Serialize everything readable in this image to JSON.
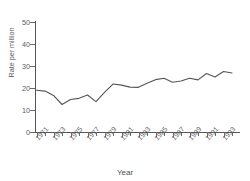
{
  "figure": {
    "title_fragment": "",
    "background": "#ffffff",
    "line_color": "#555555",
    "axis_color": "#565656",
    "text_color": "#5b5b5b"
  },
  "chart_data": {
    "type": "line",
    "title": "",
    "xlabel": "Year",
    "ylabel": "Rate per million",
    "ylim": [
      0,
      50
    ],
    "xlim": [
      1971,
      1994
    ],
    "yticks": [
      0,
      10,
      20,
      30,
      40,
      50
    ],
    "ytick_labels": [
      "0",
      "10",
      "20",
      "30",
      "40",
      "50"
    ],
    "xtick_labels": [
      "1971",
      "1973",
      "1975",
      "1977",
      "1979",
      "1981",
      "1983",
      "1985",
      "1987",
      "1989",
      "1991",
      "1993"
    ],
    "grid": false,
    "legend": false,
    "x": [
      1971,
      1972,
      1973,
      1974,
      1975,
      1976,
      1977,
      1978,
      1979,
      1980,
      1981,
      1982,
      1983,
      1984,
      1985,
      1986,
      1987,
      1988,
      1989,
      1990,
      1991,
      1992,
      1993,
      1994
    ],
    "values": [
      19.0,
      18.6,
      16.6,
      12.5,
      14.8,
      15.3,
      16.8,
      13.8,
      18.0,
      21.8,
      21.3,
      20.4,
      20.3,
      22.2,
      23.8,
      24.4,
      22.6,
      23.2,
      24.4,
      23.7,
      26.6,
      25.0,
      27.5,
      26.8
    ],
    "series_name": "Rate per million"
  }
}
